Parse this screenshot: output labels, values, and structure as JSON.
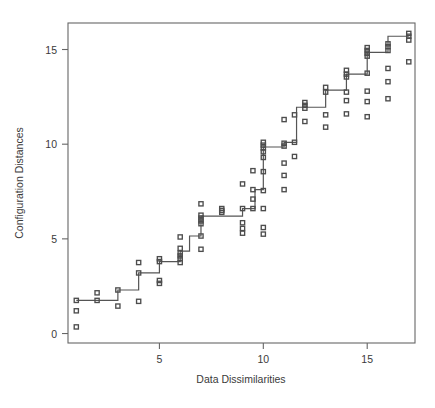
{
  "chart_data": {
    "type": "scatter",
    "title": "",
    "xlabel": "Data Dissimilarities",
    "ylabel": "Configuration Distances",
    "xlim": [
      0.6,
      17.3
    ],
    "ylim": [
      -0.5,
      16.4
    ],
    "xticks": [
      5,
      10,
      15
    ],
    "xtick_labels": [
      "5",
      "10",
      "15"
    ],
    "yticks": [
      0,
      5,
      10,
      15
    ],
    "ytick_labels": [
      "0",
      "5",
      "10",
      "15"
    ],
    "grid": false,
    "legend": null,
    "marker": "square",
    "marker_color": "#4d4d4d",
    "line_color": "#555555",
    "axis_color": "#666666",
    "points": [
      [
        1.0,
        1.75
      ],
      [
        1.0,
        1.2
      ],
      [
        1.0,
        0.35
      ],
      [
        2.0,
        2.15
      ],
      [
        2.0,
        1.75
      ],
      [
        3.0,
        2.3
      ],
      [
        3.0,
        1.45
      ],
      [
        4.0,
        3.75
      ],
      [
        4.0,
        3.2
      ],
      [
        4.0,
        1.7
      ],
      [
        5.0,
        3.95
      ],
      [
        5.0,
        3.8
      ],
      [
        5.0,
        2.8
      ],
      [
        5.0,
        2.65
      ],
      [
        6.0,
        5.1
      ],
      [
        6.0,
        4.5
      ],
      [
        6.0,
        4.25
      ],
      [
        6.0,
        4.1
      ],
      [
        6.0,
        3.95
      ],
      [
        6.0,
        3.75
      ],
      [
        7.0,
        6.85
      ],
      [
        7.0,
        6.25
      ],
      [
        7.0,
        6.1
      ],
      [
        7.0,
        5.95
      ],
      [
        7.0,
        5.8
      ],
      [
        7.0,
        5.15
      ],
      [
        7.0,
        4.45
      ],
      [
        8.0,
        6.6
      ],
      [
        8.0,
        6.5
      ],
      [
        8.0,
        6.4
      ],
      [
        9.0,
        7.9
      ],
      [
        9.0,
        6.6
      ],
      [
        9.0,
        5.85
      ],
      [
        9.0,
        5.55
      ],
      [
        9.0,
        5.3
      ],
      [
        9.5,
        8.6
      ],
      [
        9.5,
        7.6
      ],
      [
        9.5,
        7.1
      ],
      [
        9.5,
        6.6
      ],
      [
        10.0,
        10.1
      ],
      [
        10.0,
        9.95
      ],
      [
        10.0,
        9.8
      ],
      [
        10.0,
        9.6
      ],
      [
        10.0,
        9.3
      ],
      [
        10.0,
        8.55
      ],
      [
        10.0,
        7.55
      ],
      [
        10.0,
        6.6
      ],
      [
        10.0,
        5.6
      ],
      [
        10.0,
        5.25
      ],
      [
        11.0,
        11.3
      ],
      [
        11.0,
        10.05
      ],
      [
        11.0,
        9.9
      ],
      [
        11.0,
        9.0
      ],
      [
        11.0,
        8.35
      ],
      [
        11.0,
        7.6
      ],
      [
        11.5,
        11.55
      ],
      [
        11.5,
        10.1
      ],
      [
        11.5,
        9.35
      ],
      [
        12.0,
        12.2
      ],
      [
        12.0,
        12.05
      ],
      [
        12.0,
        11.9
      ],
      [
        12.0,
        11.2
      ],
      [
        13.0,
        13.0
      ],
      [
        13.0,
        12.75
      ],
      [
        13.0,
        11.55
      ],
      [
        13.0,
        10.9
      ],
      [
        14.0,
        13.9
      ],
      [
        14.0,
        13.7
      ],
      [
        14.0,
        13.55
      ],
      [
        14.0,
        12.75
      ],
      [
        14.0,
        12.3
      ],
      [
        14.0,
        11.6
      ],
      [
        15.0,
        15.1
      ],
      [
        15.0,
        14.95
      ],
      [
        15.0,
        14.8
      ],
      [
        15.0,
        14.65
      ],
      [
        15.0,
        13.75
      ],
      [
        15.0,
        12.8
      ],
      [
        15.0,
        12.25
      ],
      [
        15.0,
        11.45
      ],
      [
        16.0,
        15.3
      ],
      [
        16.0,
        15.15
      ],
      [
        16.0,
        14.95
      ],
      [
        16.0,
        14.0
      ],
      [
        16.0,
        13.3
      ],
      [
        16.0,
        12.4
      ],
      [
        17.0,
        15.85
      ],
      [
        17.0,
        15.7
      ],
      [
        17.0,
        15.5
      ],
      [
        17.0,
        14.35
      ]
    ],
    "fit_line_label": "monotone step fit",
    "fit_line": [
      [
        1.0,
        1.75
      ],
      [
        3.0,
        1.75
      ],
      [
        3.0,
        2.3
      ],
      [
        4.0,
        2.3
      ],
      [
        4.0,
        3.2
      ],
      [
        5.0,
        3.2
      ],
      [
        5.0,
        3.8
      ],
      [
        6.0,
        3.8
      ],
      [
        6.0,
        4.35
      ],
      [
        6.45,
        4.35
      ],
      [
        6.45,
        5.15
      ],
      [
        7.0,
        5.15
      ],
      [
        7.0,
        6.2
      ],
      [
        9.0,
        6.2
      ],
      [
        9.0,
        6.6
      ],
      [
        9.6,
        6.6
      ],
      [
        9.6,
        7.6
      ],
      [
        10.0,
        7.6
      ],
      [
        10.0,
        9.85
      ],
      [
        11.0,
        9.85
      ],
      [
        11.0,
        10.1
      ],
      [
        11.6,
        10.1
      ],
      [
        11.6,
        11.95
      ],
      [
        13.0,
        11.95
      ],
      [
        13.0,
        12.85
      ],
      [
        14.0,
        12.85
      ],
      [
        14.0,
        13.7
      ],
      [
        15.0,
        13.7
      ],
      [
        15.0,
        14.85
      ],
      [
        16.0,
        14.85
      ],
      [
        16.0,
        15.7
      ],
      [
        17.0,
        15.7
      ]
    ]
  }
}
